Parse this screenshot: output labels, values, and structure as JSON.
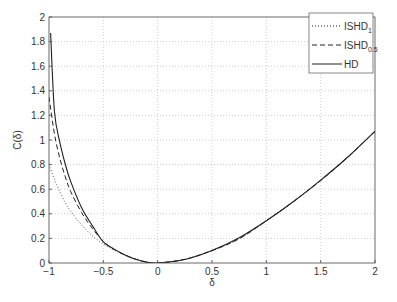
{
  "chart_data": {
    "type": "line",
    "title": "",
    "xlabel": "δ",
    "ylabel": "C(δ)",
    "xlim": [
      -1,
      2
    ],
    "ylim": [
      0,
      2
    ],
    "grid": true,
    "legend_position": "upper right",
    "x_ticks": [
      "-1",
      "-0.5",
      "0",
      "0.5",
      "1",
      "1.5",
      "2"
    ],
    "y_ticks": [
      "0",
      "0.2",
      "0.4",
      "0.6",
      "0.8",
      "1",
      "1.2",
      "1.4",
      "1.6",
      "1.8",
      "2"
    ],
    "x": [
      -1.0,
      -0.95,
      -0.9,
      -0.85,
      -0.8,
      -0.7,
      -0.6,
      -0.5,
      -0.4,
      -0.3,
      -0.2,
      -0.1,
      0.0,
      0.25,
      0.5,
      0.75,
      1.0,
      1.25,
      1.5,
      1.75,
      2.0
    ],
    "series": [
      {
        "name": "ISHD_1",
        "legend_main": "ISHD",
        "legend_sub": "1",
        "style": "dotted",
        "values": [
          0.8,
          0.68,
          0.58,
          0.49,
          0.42,
          0.31,
          0.22,
          0.155,
          0.105,
          0.062,
          0.028,
          0.007,
          0.0,
          0.03,
          0.101,
          0.197,
          0.343,
          0.5,
          0.67,
          0.86,
          1.07
        ]
      },
      {
        "name": "ISHD_0.5",
        "legend_main": "ISHD",
        "legend_sub": "0.5",
        "style": "dashed",
        "values": [
          1.35,
          1.05,
          0.85,
          0.7,
          0.58,
          0.41,
          0.28,
          0.175,
          0.11,
          0.065,
          0.03,
          0.007,
          0.0,
          0.03,
          0.101,
          0.197,
          0.343,
          0.5,
          0.67,
          0.86,
          1.07
        ]
      },
      {
        "name": "HD",
        "legend_main": "HD",
        "legend_sub": "",
        "style": "solid",
        "values": [
          2.0,
          1.234,
          0.98,
          0.802,
          0.662,
          0.45,
          0.302,
          0.172,
          0.113,
          0.066,
          0.03,
          0.007,
          0.0,
          0.028,
          0.101,
          0.205,
          0.343,
          0.5,
          0.674,
          0.862,
          1.072
        ]
      }
    ]
  }
}
